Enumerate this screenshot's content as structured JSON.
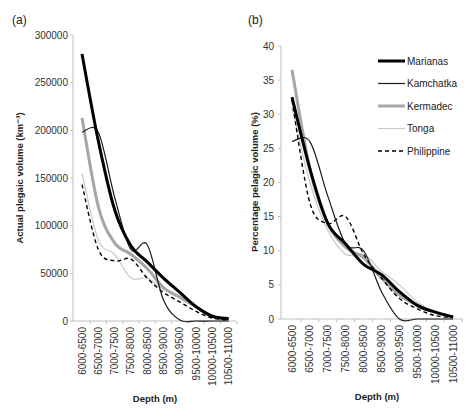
{
  "chart_data": [
    {
      "panel": "(a)",
      "type": "line",
      "title": "",
      "xlabel": "Depth (m)",
      "ylabel": "Actual plegaic volume (km⁻³)",
      "ylim": [
        0,
        300000
      ],
      "yticks": [
        0,
        50000,
        100000,
        150000,
        200000,
        250000,
        300000
      ],
      "grid": false,
      "categories": [
        "6000-6500",
        "6500-7000",
        "7000-7500",
        "7500-8000",
        "8000-8500",
        "8500-9000",
        "9000-9500",
        "9500-10000",
        "10000-10500",
        "10500-11000"
      ],
      "series": [
        {
          "name": "Marianas",
          "style": "thick-black",
          "values": [
            280000,
            189000,
            117000,
            79000,
            62000,
            45000,
            30000,
            15000,
            5000,
            2500
          ]
        },
        {
          "name": "Kamchatka",
          "style": "thin-black",
          "values": [
            198000,
            198000,
            130000,
            75000,
            80000,
            22000,
            1000,
            0,
            0,
            0
          ]
        },
        {
          "name": "Kermadec",
          "style": "thick-gray",
          "values": [
            213000,
            120000,
            82000,
            70000,
            55000,
            35000,
            25000,
            15000,
            5000,
            1000
          ]
        },
        {
          "name": "Tonga",
          "style": "thin-lightgray",
          "values": [
            155000,
            85000,
            70000,
            45000,
            45000,
            33000,
            25000,
            15000,
            5000,
            1000
          ]
        },
        {
          "name": "Philippine",
          "style": "dashed-black",
          "values": [
            143000,
            75000,
            63000,
            65000,
            45000,
            30000,
            20000,
            10000,
            3000,
            1000
          ]
        }
      ]
    },
    {
      "panel": "(b)",
      "type": "line",
      "title": "",
      "xlabel": "Depth (m)",
      "ylabel": "Percentage pelagic volume (%)",
      "ylim": [
        0,
        40
      ],
      "yticks": [
        0,
        5,
        10,
        15,
        20,
        25,
        30,
        35,
        40
      ],
      "grid": false,
      "legend_position": "upper right",
      "categories": [
        "6000-6500",
        "6500-7000",
        "7000-7500",
        "7500-8000",
        "8000-8500",
        "8500-9000",
        "9000-9500",
        "9500-10000",
        "10000-10500",
        "10500-11000"
      ],
      "series": [
        {
          "name": "Marianas",
          "style": "thick-black",
          "values": [
            32.5,
            22,
            14,
            11,
            8,
            6.5,
            4,
            2,
            1,
            0.3
          ]
        },
        {
          "name": "Kamchatka",
          "style": "thin-black",
          "values": [
            26,
            26,
            18,
            11,
            10,
            4,
            0,
            0,
            0,
            0
          ]
        },
        {
          "name": "Kermadec",
          "style": "thick-gray",
          "values": [
            36.5,
            22,
            14,
            10.5,
            9,
            6,
            3.5,
            2,
            1,
            0.3
          ]
        },
        {
          "name": "Tonga",
          "style": "thin-lightgray",
          "values": [
            31,
            20,
            13,
            9.5,
            9.5,
            7,
            5,
            2.5,
            1,
            0.3
          ]
        },
        {
          "name": "Philippine",
          "style": "dashed-black",
          "values": [
            32,
            17,
            14,
            15,
            9.5,
            6,
            3,
            1.5,
            0.5,
            0.2
          ]
        }
      ]
    }
  ],
  "legend": [
    "Marianas",
    "Kamchatka",
    "Kermadec",
    "Tonga",
    "Philippine"
  ],
  "styles": {
    "thick-black": {
      "color": "#000000",
      "width": 3,
      "dash": ""
    },
    "thin-black": {
      "color": "#1a1a1a",
      "width": 1.2,
      "dash": ""
    },
    "thick-gray": {
      "color": "#a6a6a6",
      "width": 3,
      "dash": ""
    },
    "thin-lightgray": {
      "color": "#c8c8c8",
      "width": 1.2,
      "dash": ""
    },
    "dashed-black": {
      "color": "#000000",
      "width": 1.4,
      "dash": "4,3"
    }
  }
}
